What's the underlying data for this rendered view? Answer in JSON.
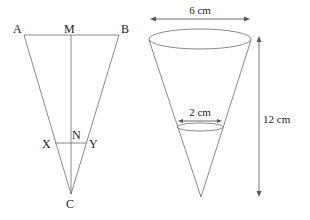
{
  "left_figure": {
    "description": "Cross-section triangle of cone",
    "points": {
      "A": "A",
      "M": "M",
      "B": "B",
      "X": "X",
      "N": "N",
      "Y": "Y",
      "C": "C"
    },
    "segments": [
      "AB",
      "AC",
      "BC",
      "MC",
      "XY"
    ]
  },
  "right_figure": {
    "description": "Cone with top diameter, smaller section diameter and height",
    "top_diameter_label": "6 cm",
    "section_diameter_label": "2 cm",
    "height_label": "12 cm"
  },
  "colors": {
    "line": "#7a7a7a",
    "arrow": "#5a5a5a",
    "text": "#1a1a1a"
  }
}
